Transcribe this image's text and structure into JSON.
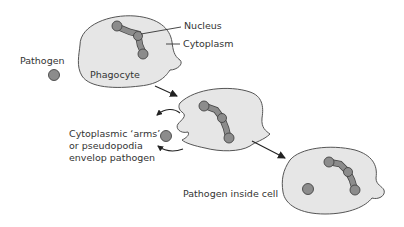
{
  "diagram": {
    "labels": {
      "nucleus": "Nucleus",
      "cytoplasm": "Cytoplasm",
      "pathogen": "Pathogen",
      "phagocyte": "Phagocyte",
      "arms_line1": "Cytoplasmic ‘arms’",
      "arms_line2": "or pseudopodia",
      "arms_line3": "envelop pathogen",
      "inside": "Pathogen inside cell"
    },
    "stages": [
      {
        "id": "stage-1",
        "description": "Phagocyte approaches pathogen"
      },
      {
        "id": "stage-2",
        "description": "Cytoplasmic arms envelop pathogen"
      },
      {
        "id": "stage-3",
        "description": "Pathogen inside cell"
      }
    ],
    "colors": {
      "cell_fill": "#e6e6e6",
      "cell_stroke": "#555555",
      "nucleus_fill": "#8c8c8c",
      "pathogen_fill": "#8c8c8c",
      "text": "#333333"
    }
  }
}
